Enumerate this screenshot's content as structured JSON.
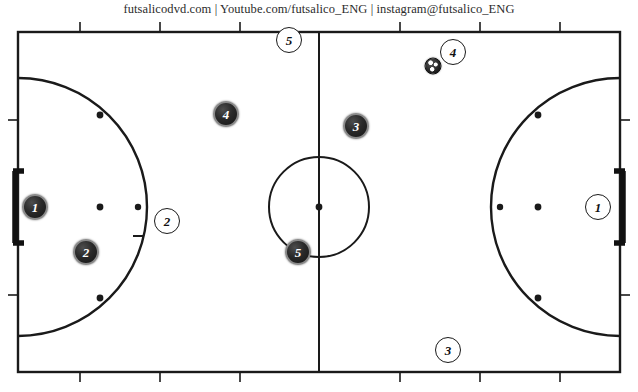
{
  "header": {
    "credit": "futsalicodvd.com | Youtube.com/futsalico_ENG | instagram@futsalico_ENG"
  },
  "court": {
    "surface_color": "#ffffff",
    "line_color": "#1a1a1a",
    "width": 638,
    "height": 372,
    "bounds": {
      "left": 18,
      "top": 12,
      "right": 620,
      "bottom": 352
    },
    "halfway_line_x": 319,
    "center_circle_radius": 50,
    "center_spot": {
      "x": 319,
      "y": 187
    },
    "penalty_arc_radius": 120,
    "touchline_ticks_top": [
      80,
      160,
      240,
      400,
      480,
      560
    ],
    "touchline_ticks_bottom": [
      80,
      160,
      240,
      400,
      480,
      560
    ],
    "goal_line_ticks_left": [
      100,
      275
    ],
    "goal_line_ticks_right": [
      100,
      275
    ],
    "penalty_spots": [
      {
        "x": 100,
        "y": 95
      },
      {
        "x": 100,
        "y": 187
      },
      {
        "x": 100,
        "y": 278
      },
      {
        "x": 538,
        "y": 95
      },
      {
        "x": 538,
        "y": 187
      },
      {
        "x": 538,
        "y": 278
      }
    ],
    "second_penalty_marks": [
      {
        "x": 138,
        "y": 187
      },
      {
        "x": 138,
        "y": 216
      },
      {
        "x": 500,
        "y": 187
      }
    ],
    "goals": [
      {
        "name": "left-goal",
        "x": 18,
        "y": 187,
        "width": 11,
        "height": 72
      },
      {
        "name": "right-goal",
        "x": 620,
        "y": 187,
        "width": 11,
        "height": 72
      }
    ]
  },
  "players": {
    "dark_team": [
      {
        "number": "1",
        "role": "goalkeeper",
        "x": 35,
        "y": 187
      },
      {
        "number": "2",
        "role": "defender",
        "x": 86,
        "y": 232
      },
      {
        "number": "4",
        "role": "winger",
        "x": 226,
        "y": 94
      },
      {
        "number": "3",
        "role": "winger",
        "x": 356,
        "y": 106
      },
      {
        "number": "5",
        "role": "pivot",
        "x": 298,
        "y": 232
      }
    ],
    "light_team": [
      {
        "number": "1",
        "role": "goalkeeper",
        "x": 598,
        "y": 187
      },
      {
        "number": "2",
        "role": "defender",
        "x": 167,
        "y": 201
      },
      {
        "number": "5",
        "role": "winger",
        "x": 289,
        "y": 20
      },
      {
        "number": "4",
        "role": "ball-carrier",
        "x": 453,
        "y": 32
      },
      {
        "number": "3",
        "role": "winger",
        "x": 448,
        "y": 330
      }
    ]
  },
  "ball": {
    "x": 433,
    "y": 46
  }
}
